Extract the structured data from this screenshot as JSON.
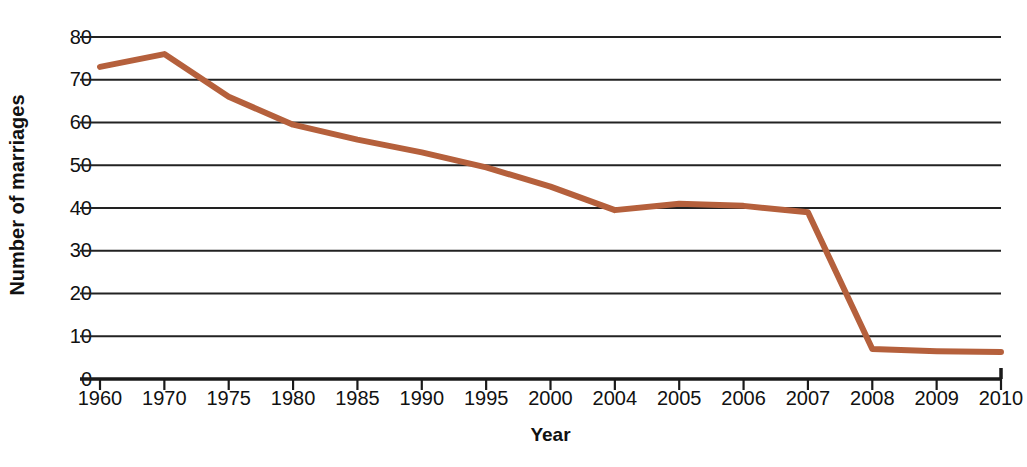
{
  "chart_data": {
    "type": "line",
    "title": "",
    "xlabel": "Year",
    "ylabel": "Number of marriages",
    "categories": [
      "1960",
      "1970",
      "1975",
      "1980",
      "1985",
      "1990",
      "1995",
      "2000",
      "2004",
      "2005",
      "2006",
      "2007",
      "2008",
      "2009",
      "2010"
    ],
    "values": [
      73,
      76,
      66,
      59.5,
      56,
      53,
      49.5,
      45,
      39.5,
      41,
      40.5,
      39,
      7,
      6.5,
      6.3
    ],
    "series": [
      {
        "name": "Number of marriages",
        "color": "#B5603C",
        "values": [
          73,
          76,
          66,
          59.5,
          56,
          53,
          49.5,
          45,
          39.5,
          41,
          40.5,
          39,
          7,
          6.5,
          6.3
        ]
      }
    ],
    "ylim": [
      0,
      80
    ],
    "y_ticks": [
      "0",
      "10",
      "20",
      "30",
      "40",
      "50",
      "60",
      "70",
      "80"
    ],
    "y_tick_values": [
      0,
      10,
      20,
      30,
      40,
      50,
      60,
      70,
      80
    ],
    "grid": "horizontal",
    "legend": "none",
    "line_color": "#B5603C",
    "line_width": 6,
    "axis_color": "#1a1a1a",
    "grid_color": "#222222",
    "background": "#ffffff"
  }
}
